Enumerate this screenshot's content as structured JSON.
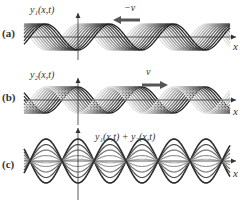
{
  "figure": {
    "panels": [
      {
        "id": "a",
        "label": "(a)",
        "y_label": "y₁(x,t)",
        "x_label": "x",
        "velocity_label": "−v⃗",
        "velocity_direction": "left",
        "description": "traveling wave moving left, multiple time snapshots in grayscale"
      },
      {
        "id": "b",
        "label": "(b)",
        "y_label": "y₂(x,t)",
        "x_label": "x",
        "velocity_label": "v⃗",
        "velocity_direction": "right",
        "description": "traveling wave moving right, multiple time snapshots in grayscale"
      },
      {
        "id": "c",
        "label": "(c)",
        "y_label": "y₁(x,t) + y₂(x,t)",
        "x_label": "x",
        "description": "standing wave formed by superposition, nodes fixed, multiple amplitude snapshots"
      }
    ],
    "colors": {
      "arrow": "#555555",
      "axis": "#333333",
      "wave_dark": "#222222",
      "wave_light": "#dddddd"
    }
  }
}
